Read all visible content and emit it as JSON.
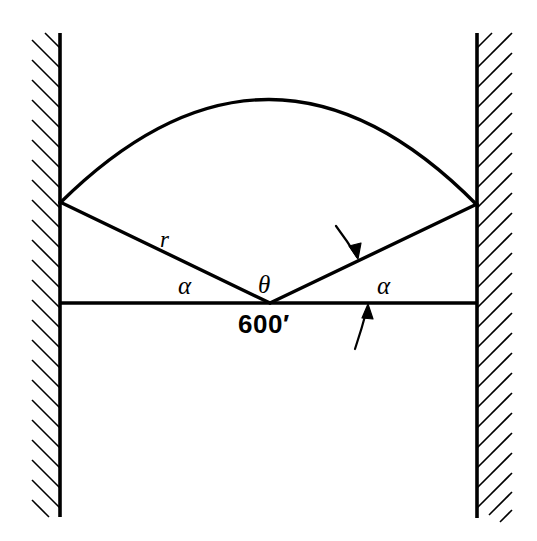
{
  "figure": {
    "type": "geometry-diagram",
    "canvas": {
      "width": 537,
      "height": 541
    },
    "stroke_color": "#000000",
    "background_color": "#ffffff",
    "labels": {
      "radius": "r",
      "alpha_left": "α",
      "alpha_right": "α",
      "theta": "θ",
      "dimension": "600′"
    },
    "geometry": {
      "left_wall": {
        "x": 60,
        "y_top": 33,
        "y_bottom": 517,
        "hatch_side": "left",
        "hatch_width": 30
      },
      "right_wall": {
        "x": 477,
        "y_top": 33,
        "y_bottom": 518,
        "hatch_side": "right",
        "hatch_width": 35
      },
      "chord": {
        "x1": 60,
        "y1": 303,
        "x2": 477,
        "y2": 303,
        "length_label": "600′"
      },
      "vertex": {
        "x": 270,
        "y": 303
      },
      "arc_left_end": {
        "x": 60,
        "y": 203
      },
      "arc_right_end": {
        "x": 477,
        "y": 205
      },
      "arc_apex": {
        "x": 270,
        "y": 75
      },
      "radius_left": {
        "x1": 270,
        "y1": 303,
        "x2": 60,
        "y2": 203
      },
      "radius_right": {
        "x1": 270,
        "y1": 303,
        "x2": 477,
        "y2": 205
      }
    },
    "annotations": [
      {
        "name": "arrow-to-radius",
        "from_x": 336,
        "from_y": 226,
        "to_x": 358,
        "to_y": 258,
        "direction": "down-right"
      },
      {
        "name": "arrow-to-chord",
        "from_x": 356,
        "from_y": 348,
        "to_x": 367,
        "to_y": 305,
        "direction": "up"
      }
    ]
  }
}
